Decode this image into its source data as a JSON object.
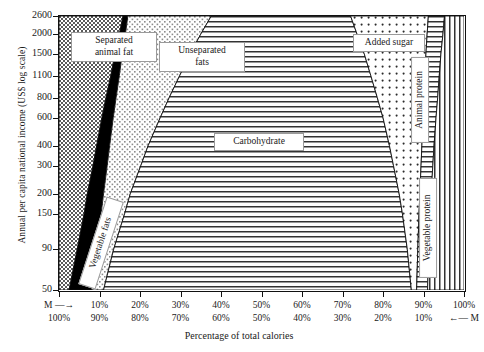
{
  "chart_data": {
    "type": "area",
    "title": "",
    "xlabel": "Percentage of total calories",
    "ylabel": "Annual per capita national income (US$ log scale)",
    "y_scale": "log",
    "ylim": [
      50,
      2600
    ],
    "xlim": [
      0,
      100
    ],
    "grid": false,
    "legend": "inline-labels",
    "y_ticks": [
      2600,
      2000,
      1500,
      1100,
      800,
      600,
      400,
      300,
      200,
      150,
      90,
      50
    ],
    "x_ticks_top": [
      "M →",
      "10%",
      "20%",
      "30%",
      "40%",
      "50%",
      "60%",
      "70%",
      "80%",
      "90%",
      "100%"
    ],
    "x_ticks_bottom": [
      "100%",
      "90%",
      "80%",
      "70%",
      "60%",
      "50%",
      "40%",
      "30%",
      "20%",
      "10%",
      "← M"
    ],
    "x_tick_values": [
      0,
      10,
      20,
      30,
      40,
      50,
      60,
      70,
      80,
      90,
      100
    ],
    "series": [
      {
        "name": "Separated animal fat",
        "fill": "dense-dotted",
        "cumulative_upper_at_income": [
          {
            "income": 50,
            "pct": 2.5
          },
          {
            "income": 90,
            "pct": 4.5
          },
          {
            "income": 150,
            "pct": 6.2
          },
          {
            "income": 200,
            "pct": 7.0
          },
          {
            "income": 300,
            "pct": 8.4
          },
          {
            "income": 400,
            "pct": 9.3
          },
          {
            "income": 600,
            "pct": 10.6
          },
          {
            "income": 800,
            "pct": 11.6
          },
          {
            "income": 1100,
            "pct": 12.8
          },
          {
            "income": 1500,
            "pct": 13.8
          },
          {
            "income": 2000,
            "pct": 14.9
          },
          {
            "income": 2600,
            "pct": 15.8
          }
        ]
      },
      {
        "name": "Vegetable fats",
        "fill": "solid-black",
        "cumulative_upper_at_income": [
          {
            "income": 50,
            "pct": 8.0
          },
          {
            "income": 90,
            "pct": 9.3
          },
          {
            "income": 150,
            "pct": 10.4
          },
          {
            "income": 200,
            "pct": 11.0
          },
          {
            "income": 300,
            "pct": 11.9
          },
          {
            "income": 400,
            "pct": 12.5
          },
          {
            "income": 600,
            "pct": 13.4
          },
          {
            "income": 800,
            "pct": 14.1
          },
          {
            "income": 1100,
            "pct": 14.9
          },
          {
            "income": 1500,
            "pct": 15.6
          },
          {
            "income": 2000,
            "pct": 16.4
          },
          {
            "income": 2600,
            "pct": 17.0
          }
        ]
      },
      {
        "name": "Unseparated fats",
        "fill": "light-stipple",
        "cumulative_upper_at_income": [
          {
            "income": 50,
            "pct": 11.0
          },
          {
            "income": 90,
            "pct": 13.5
          },
          {
            "income": 150,
            "pct": 16.2
          },
          {
            "income": 200,
            "pct": 17.6
          },
          {
            "income": 300,
            "pct": 20.2
          },
          {
            "income": 400,
            "pct": 22.0
          },
          {
            "income": 600,
            "pct": 25.0
          },
          {
            "income": 800,
            "pct": 27.2
          },
          {
            "income": 1100,
            "pct": 29.8
          },
          {
            "income": 1500,
            "pct": 32.3
          },
          {
            "income": 2000,
            "pct": 35.0
          },
          {
            "income": 2600,
            "pct": 37.6
          }
        ]
      },
      {
        "name": "Carbohydrate",
        "fill": "horizontal-lines",
        "cumulative_upper_at_income": [
          {
            "income": 50,
            "pct": 87.0
          },
          {
            "income": 90,
            "pct": 86.0
          },
          {
            "income": 150,
            "pct": 84.8
          },
          {
            "income": 200,
            "pct": 84.0
          },
          {
            "income": 300,
            "pct": 82.6
          },
          {
            "income": 400,
            "pct": 81.6
          },
          {
            "income": 600,
            "pct": 80.0
          },
          {
            "income": 800,
            "pct": 78.6
          },
          {
            "income": 1100,
            "pct": 77.0
          },
          {
            "income": 1500,
            "pct": 75.4
          },
          {
            "income": 2000,
            "pct": 73.6
          },
          {
            "income": 2600,
            "pct": 72.0
          }
        ]
      },
      {
        "name": "Added sugar",
        "fill": "sparse-dots",
        "cumulative_upper_at_income": [
          {
            "income": 50,
            "pct": 88.3
          },
          {
            "income": 90,
            "pct": 88.6
          },
          {
            "income": 150,
            "pct": 88.9
          },
          {
            "income": 200,
            "pct": 89.1
          },
          {
            "income": 300,
            "pct": 89.4
          },
          {
            "income": 400,
            "pct": 89.6
          },
          {
            "income": 600,
            "pct": 89.9
          },
          {
            "income": 800,
            "pct": 90.1
          },
          {
            "income": 1100,
            "pct": 90.4
          },
          {
            "income": 1500,
            "pct": 90.6
          },
          {
            "income": 2000,
            "pct": 90.9
          },
          {
            "income": 2600,
            "pct": 91.2
          }
        ]
      },
      {
        "name": "Animal protein",
        "fill": "horizontal-lines",
        "cumulative_upper_at_income": [
          {
            "income": 50,
            "pct": 91.0
          },
          {
            "income": 90,
            "pct": 91.3
          },
          {
            "income": 150,
            "pct": 91.7
          },
          {
            "income": 200,
            "pct": 91.9
          },
          {
            "income": 300,
            "pct": 92.3
          },
          {
            "income": 400,
            "pct": 92.6
          },
          {
            "income": 600,
            "pct": 93.1
          },
          {
            "income": 800,
            "pct": 93.5
          },
          {
            "income": 1100,
            "pct": 93.9
          },
          {
            "income": 1500,
            "pct": 94.3
          },
          {
            "income": 2000,
            "pct": 94.8
          },
          {
            "income": 2600,
            "pct": 95.2
          }
        ]
      },
      {
        "name": "Vegetable protein",
        "fill": "vertical-lines",
        "cumulative_upper_at_income": [
          {
            "income": 50,
            "pct": 100
          },
          {
            "income": 2600,
            "pct": 100
          }
        ]
      }
    ]
  },
  "axes": {
    "y_title": "Annual per capita national income (US$ log scale)",
    "x_title": "Percentage of total calories",
    "y_ticks": [
      "2600",
      "2000",
      "1500",
      "1100",
      "800",
      "600",
      "400",
      "300",
      "200",
      "150",
      "90",
      "50"
    ],
    "x_ticks_top": [
      "M —→",
      "10%",
      "20%",
      "30%",
      "40%",
      "50%",
      "60%",
      "70%",
      "80%",
      "90%",
      "100%"
    ],
    "x_ticks_bottom": [
      "100%",
      "90%",
      "80%",
      "70%",
      "60%",
      "50%",
      "40%",
      "30%",
      "20%",
      "10%",
      "←— M"
    ]
  },
  "labels": {
    "separated_animal_fat": "Separated animal fat",
    "separated_animal_fat_l1": "Separated",
    "separated_animal_fat_l2": "animal fat",
    "vegetable_fats": "Vegetable fats",
    "unseparated_fats": "Unseparated fats",
    "unseparated_fats_l1": "Unseparated",
    "unseparated_fats_l2": "fats",
    "carbohydrate": "Carbohydrate",
    "added_sugar": "Added sugar",
    "animal_protein": "Animal protein",
    "vegetable_protein": "Vegetable protein"
  },
  "colors": {
    "ink": "#111111",
    "background": "#ffffff",
    "vegetable_fats_fill": "#000000",
    "label_border": "#9a9a9a"
  }
}
